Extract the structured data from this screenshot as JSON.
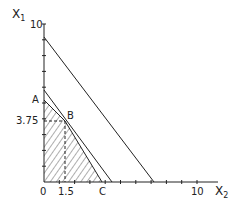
{
  "diagram": {
    "type": "linear-programming-feasible-region",
    "axes": {
      "vertical": {
        "title": "X",
        "subscript": "1",
        "tick_label_top": "10"
      },
      "horizontal": {
        "title": "X",
        "subscript": "2",
        "tick_label_right": "10"
      }
    },
    "origin_label": "0",
    "points": {
      "A": {
        "label": "A"
      },
      "B": {
        "label": "B",
        "x1": "3.75",
        "x2": "1.5"
      },
      "C": {
        "label": "C"
      }
    },
    "tick_values": {
      "x1_B": "3.75",
      "x2_B": "1.5"
    },
    "colors": {
      "line": "#222222",
      "hatch": "#333333",
      "background": "#ffffff"
    }
  }
}
